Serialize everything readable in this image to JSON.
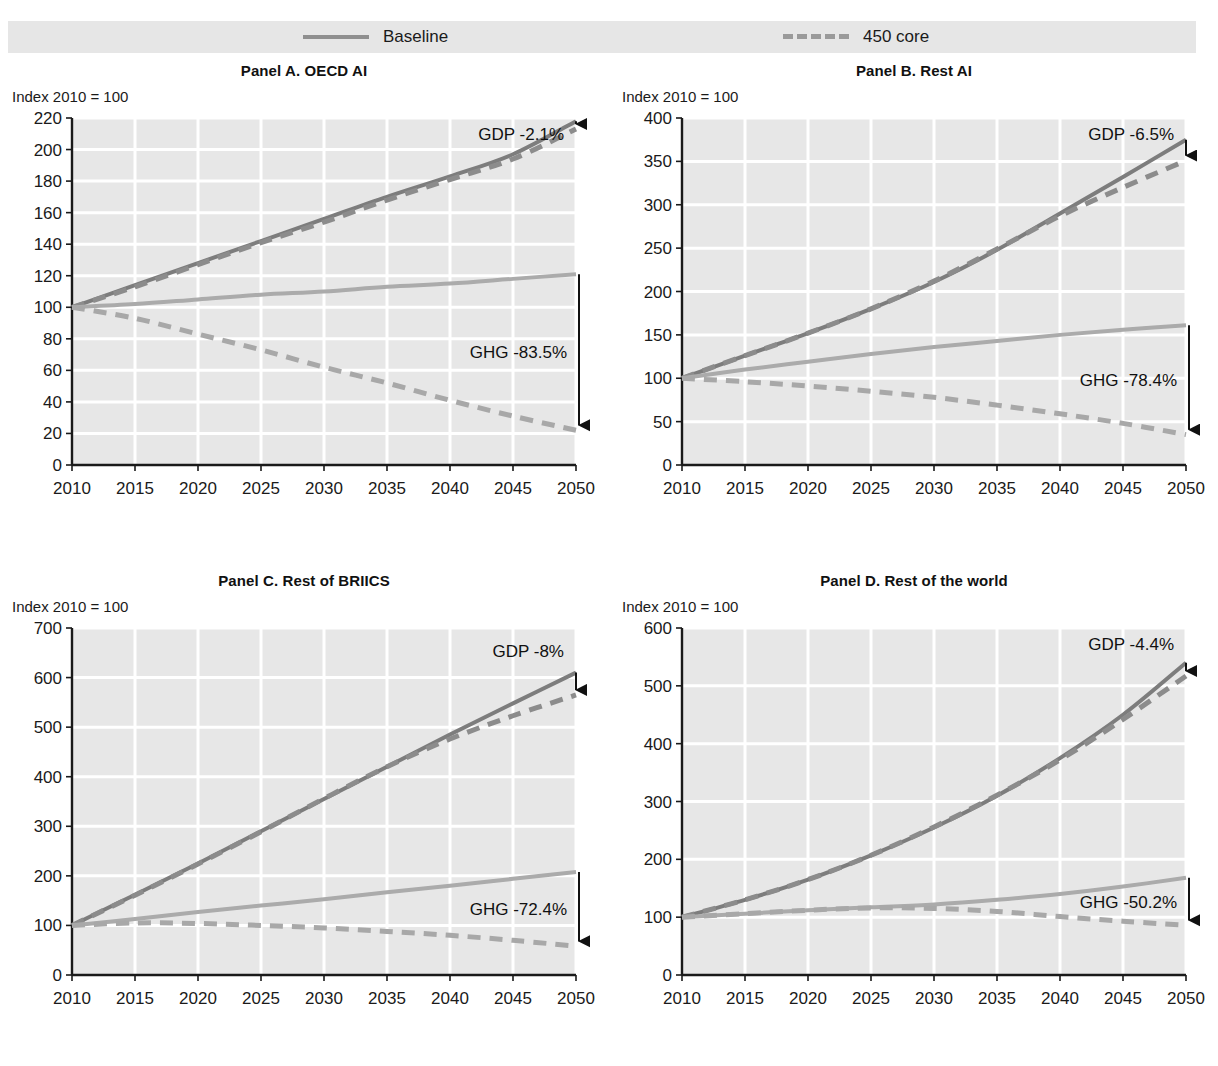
{
  "figure": {
    "title_cut": "",
    "index_note": "Index 2010 = 100"
  },
  "legend": {
    "position": "top",
    "entries": [
      {
        "label": "Baseline",
        "style": "solid",
        "color": "#8f8f8f",
        "icon": "solid-line-swatch"
      },
      {
        "label": "450 core",
        "style": "dashed",
        "color": "#9a9a9a",
        "icon": "dashed-line-swatch"
      }
    ]
  },
  "colors": {
    "plot_background": "#e7e7e7",
    "gridline": "#ffffff",
    "axis": "#1a1a1a",
    "gdp_baseline": "#7d7d7d",
    "gdp_450core": "#8c8c8c",
    "ghg_baseline": "#ababab",
    "ghg_450core": "#a8a8a8",
    "annotation_arrow": "#111111"
  },
  "chart_data": [
    {
      "type": "line",
      "panel_id": "A",
      "title": "Panel A. OECD AI",
      "ylabel": "Index 2010 = 100",
      "xlabel": "",
      "ylim": [
        0,
        220
      ],
      "yticks": [
        0,
        20,
        40,
        60,
        80,
        100,
        120,
        140,
        160,
        180,
        200,
        220
      ],
      "xlim": [
        2010,
        2050
      ],
      "x": [
        2010,
        2015,
        2020,
        2025,
        2030,
        2035,
        2040,
        2045,
        2050
      ],
      "xticks": [
        2010,
        2015,
        2020,
        2025,
        2030,
        2035,
        2040,
        2045,
        2050
      ],
      "grid": true,
      "series": [
        {
          "name": "GDP Baseline",
          "variable": "GDP",
          "scenario": "Baseline",
          "style": "solid",
          "values": [
            100,
            114,
            128,
            142,
            156,
            170,
            183,
            197,
            218
          ]
        },
        {
          "name": "GDP 450 core",
          "variable": "GDP",
          "scenario": "450 core",
          "style": "dashed",
          "values": [
            100,
            113,
            127,
            141,
            154,
            168,
            181,
            194,
            213
          ]
        },
        {
          "name": "GHG Baseline",
          "variable": "GHG",
          "scenario": "Baseline",
          "style": "solid",
          "values": [
            100,
            102,
            105,
            108,
            110,
            113,
            115,
            118,
            121
          ]
        },
        {
          "name": "GHG 450 core",
          "variable": "GHG",
          "scenario": "450 core",
          "style": "dashed",
          "values": [
            100,
            93,
            83,
            73,
            62,
            52,
            41,
            31,
            22
          ]
        }
      ],
      "annotations": [
        {
          "text": "GDP -2.1%",
          "kind": "gdp-gap",
          "x": 2050,
          "y_top": 218,
          "y_bottom": 213
        },
        {
          "text": "GHG -83.5%",
          "kind": "ghg-gap",
          "x": 2050,
          "y_top": 121,
          "y_bottom": 22
        }
      ]
    },
    {
      "type": "line",
      "panel_id": "B",
      "title": "Panel B. Rest AI",
      "ylabel": "Index 2010 = 100",
      "xlabel": "",
      "ylim": [
        0,
        400
      ],
      "yticks": [
        0,
        50,
        100,
        150,
        200,
        250,
        300,
        350,
        400
      ],
      "xlim": [
        2010,
        2050
      ],
      "x": [
        2010,
        2015,
        2020,
        2025,
        2030,
        2035,
        2040,
        2045,
        2050
      ],
      "xticks": [
        2010,
        2015,
        2020,
        2025,
        2030,
        2035,
        2040,
        2045,
        2050
      ],
      "grid": true,
      "series": [
        {
          "name": "GDP Baseline",
          "variable": "GDP",
          "scenario": "Baseline",
          "style": "solid",
          "values": [
            100,
            126,
            152,
            180,
            211,
            248,
            290,
            332,
            375
          ]
        },
        {
          "name": "GDP 450 core",
          "variable": "GDP",
          "scenario": "450 core",
          "style": "dashed",
          "values": [
            100,
            126,
            152,
            180,
            212,
            249,
            287,
            320,
            351
          ]
        },
        {
          "name": "GHG Baseline",
          "variable": "GHG",
          "scenario": "Baseline",
          "style": "solid",
          "values": [
            100,
            110,
            119,
            128,
            136,
            143,
            150,
            156,
            161
          ]
        },
        {
          "name": "GHG 450 core",
          "variable": "GHG",
          "scenario": "450 core",
          "style": "dashed",
          "values": [
            100,
            96,
            91,
            85,
            78,
            69,
            59,
            48,
            35
          ]
        }
      ],
      "annotations": [
        {
          "text": "GDP -6.5%",
          "kind": "gdp-gap",
          "x": 2050,
          "y_top": 375,
          "y_bottom": 351
        },
        {
          "text": "GHG -78.4%",
          "kind": "ghg-gap",
          "x": 2050,
          "y_top": 161,
          "y_bottom": 35
        }
      ]
    },
    {
      "type": "line",
      "panel_id": "C",
      "title": "Panel C. Rest of BRIICS",
      "ylabel": "Index 2010 = 100",
      "xlabel": "",
      "ylim": [
        0,
        700
      ],
      "yticks": [
        0,
        100,
        200,
        300,
        400,
        500,
        600,
        700
      ],
      "xlim": [
        2010,
        2050
      ],
      "x": [
        2010,
        2015,
        2020,
        2025,
        2030,
        2035,
        2040,
        2045,
        2050
      ],
      "xticks": [
        2010,
        2015,
        2020,
        2025,
        2030,
        2035,
        2040,
        2045,
        2050
      ],
      "grid": true,
      "series": [
        {
          "name": "GDP Baseline",
          "variable": "GDP",
          "scenario": "Baseline",
          "style": "solid",
          "values": [
            100,
            162,
            225,
            290,
            355,
            420,
            485,
            548,
            610
          ]
        },
        {
          "name": "GDP 450 core",
          "variable": "GDP",
          "scenario": "450 core",
          "style": "dashed",
          "values": [
            100,
            161,
            224,
            289,
            356,
            420,
            476,
            523,
            565
          ]
        },
        {
          "name": "GHG Baseline",
          "variable": "GHG",
          "scenario": "Baseline",
          "style": "solid",
          "values": [
            100,
            113,
            127,
            140,
            153,
            167,
            180,
            194,
            208
          ]
        },
        {
          "name": "GHG 450 core",
          "variable": "GHG",
          "scenario": "450 core",
          "style": "dashed",
          "values": [
            100,
            105,
            104,
            100,
            95,
            88,
            80,
            70,
            58
          ]
        }
      ],
      "annotations": [
        {
          "text": "GDP -8%",
          "kind": "gdp-gap",
          "x": 2050,
          "y_top": 610,
          "y_bottom": 565
        },
        {
          "text": "GHG -72.4%",
          "kind": "ghg-gap",
          "x": 2050,
          "y_top": 208,
          "y_bottom": 58
        }
      ]
    },
    {
      "type": "line",
      "panel_id": "D",
      "title": "Panel D. Rest of the world",
      "ylabel": "Index 2010 = 100",
      "xlabel": "",
      "ylim": [
        0,
        600
      ],
      "yticks": [
        0,
        100,
        200,
        300,
        400,
        500,
        600
      ],
      "xlim": [
        2010,
        2050
      ],
      "x": [
        2010,
        2015,
        2020,
        2025,
        2030,
        2035,
        2040,
        2045,
        2050
      ],
      "xticks": [
        2010,
        2015,
        2020,
        2025,
        2030,
        2035,
        2040,
        2045,
        2050
      ],
      "grid": true,
      "series": [
        {
          "name": "GDP Baseline",
          "variable": "GDP",
          "scenario": "Baseline",
          "style": "solid",
          "values": [
            100,
            130,
            165,
            207,
            255,
            310,
            375,
            450,
            540
          ]
        },
        {
          "name": "GDP 450 core",
          "variable": "GDP",
          "scenario": "450 core",
          "style": "dashed",
          "values": [
            100,
            130,
            165,
            207,
            256,
            311,
            372,
            442,
            517
          ]
        },
        {
          "name": "GHG Baseline",
          "variable": "GHG",
          "scenario": "Baseline",
          "style": "solid",
          "values": [
            100,
            106,
            112,
            117,
            122,
            130,
            140,
            153,
            168
          ]
        },
        {
          "name": "GHG 450 core",
          "variable": "GHG",
          "scenario": "450 core",
          "style": "dashed",
          "values": [
            100,
            106,
            112,
            116,
            115,
            110,
            101,
            93,
            86
          ]
        }
      ],
      "annotations": [
        {
          "text": "GDP -4.4%",
          "kind": "gdp-gap",
          "x": 2050,
          "y_top": 540,
          "y_bottom": 517
        },
        {
          "text": "GHG -50.2%",
          "kind": "ghg-gap",
          "x": 2050,
          "y_top": 168,
          "y_bottom": 86
        }
      ]
    }
  ]
}
